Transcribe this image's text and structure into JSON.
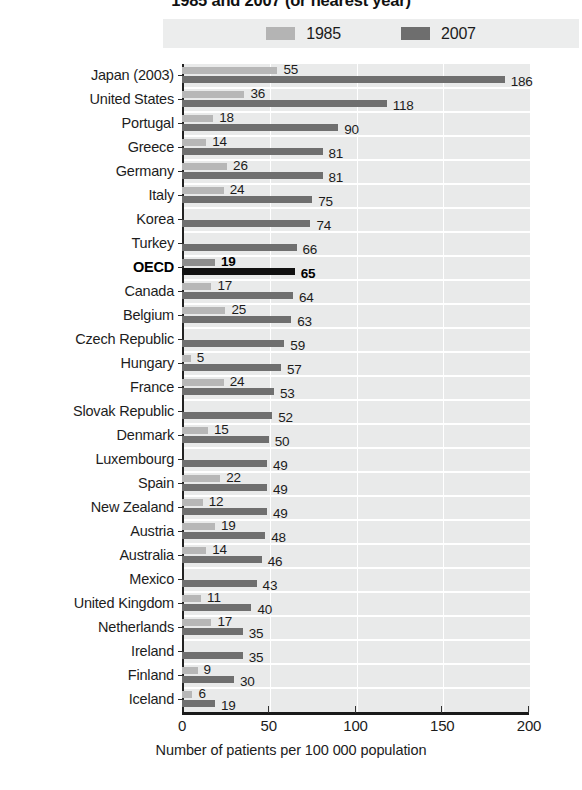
{
  "chart_data": {
    "type": "bar",
    "orientation": "horizontal",
    "title": "1985 and 2007 (or nearest year)",
    "xlabel": "Number of patients per 100 000 population",
    "ylabel": "",
    "xlim": [
      0,
      200
    ],
    "xticks": [
      0,
      50,
      100,
      150,
      200
    ],
    "grid": true,
    "legend_position": "top-center",
    "categories": [
      "Japan (2003)",
      "United States",
      "Portugal",
      "Greece",
      "Germany",
      "Italy",
      "Korea",
      "Turkey",
      "OECD",
      "Canada",
      "Belgium",
      "Czech Republic",
      "Hungary",
      "France",
      "Slovak Republic",
      "Denmark",
      "Luxembourg",
      "Spain",
      "New Zealand",
      "Austria",
      "Australia",
      "Mexico",
      "United Kingdom",
      "Netherlands",
      "Ireland",
      "Finland",
      "Iceland"
    ],
    "series": [
      {
        "name": "1985",
        "color": "#b7b7b7",
        "values": [
          55,
          36,
          18,
          14,
          26,
          24,
          null,
          null,
          19,
          17,
          25,
          null,
          5,
          24,
          null,
          15,
          null,
          22,
          12,
          19,
          14,
          null,
          11,
          17,
          null,
          9,
          6
        ]
      },
      {
        "name": "2007",
        "color": "#6f6f6f",
        "values": [
          186,
          118,
          90,
          81,
          81,
          75,
          74,
          66,
          65,
          64,
          63,
          59,
          57,
          53,
          52,
          50,
          49,
          49,
          49,
          48,
          46,
          43,
          40,
          35,
          35,
          30,
          19
        ]
      }
    ],
    "highlight_category": "OECD"
  },
  "legend": {
    "items": [
      {
        "label": "1985",
        "swatch_class": "s1985"
      },
      {
        "label": "2007",
        "swatch_class": "s2007"
      }
    ]
  },
  "xaxis": {
    "title": "Number of patients per 100 000 population",
    "tick_labels": [
      "0",
      "50",
      "100",
      "150",
      "200"
    ]
  },
  "title": "1985 and 2007 (or nearest year)"
}
